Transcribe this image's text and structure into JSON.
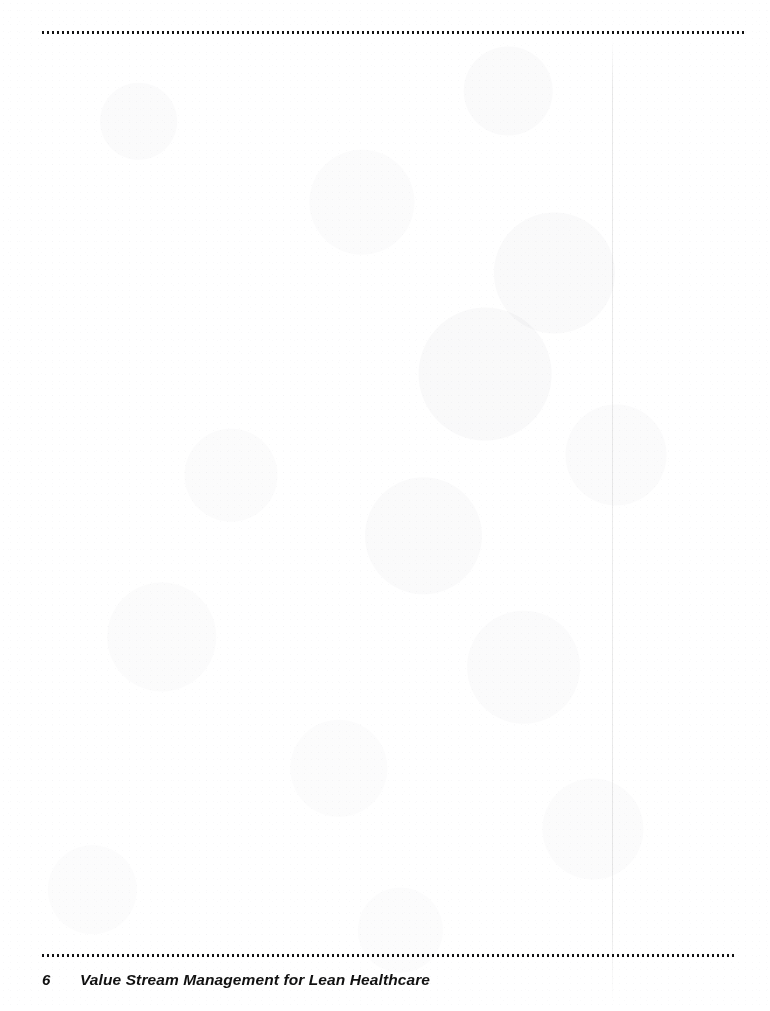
{
  "page": {
    "kind": "scanned-book-page",
    "background_color": "#ffffff",
    "ink_color": "#111111",
    "width": 770,
    "height": 1011,
    "body_text": ""
  },
  "rules": {
    "top_rule_name": "dotted-rule-top",
    "bottom_rule_name": "dotted-rule-bottom",
    "style": "dotted",
    "color": "#111111"
  },
  "gutter": {
    "name": "scan-spine-line",
    "color": "rgba(0,0,0,0.08)"
  },
  "footer": {
    "page_number": "6",
    "title": "Value Stream Management for Lean Healthcare"
  }
}
